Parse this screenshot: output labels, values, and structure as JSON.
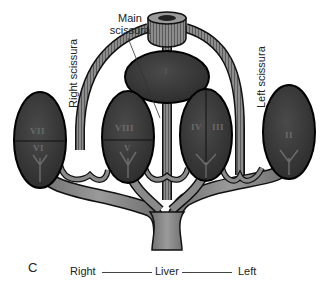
{
  "figure": {
    "panel_letter": "C",
    "labels": {
      "main_scissura": [
        "Main",
        "scissura"
      ],
      "right_scissura": "Right scissura",
      "left_scissura": "Left scissura"
    },
    "segments": [
      {
        "id": "I",
        "label": "I"
      },
      {
        "id": "II",
        "label": "II"
      },
      {
        "id": "III",
        "label": "III"
      },
      {
        "id": "IV",
        "label": "IV"
      },
      {
        "id": "V",
        "label": "V"
      },
      {
        "id": "VI",
        "label": "VI"
      },
      {
        "id": "VII",
        "label": "VII"
      },
      {
        "id": "VIII",
        "label": "VIII"
      }
    ],
    "axis": {
      "left_label": "Right",
      "center_label": "Liver",
      "right_label": "Left"
    },
    "colors": {
      "segment_fill": "#3a3a3a",
      "vessel_fill": "#8a8a8a",
      "outline": "#111111",
      "text": "#222222"
    }
  }
}
